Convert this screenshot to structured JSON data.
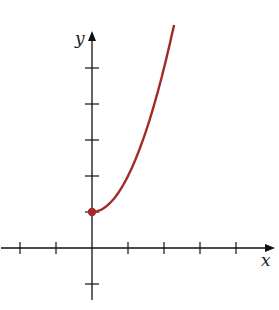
{
  "chart_data": {
    "type": "line",
    "title": "",
    "xlabel": "x",
    "ylabel": "y",
    "function": "y = x^2 + 1, x >= 0",
    "series": [
      {
        "name": "curve",
        "color": "#a32a2a",
        "x": [
          0,
          0.5,
          1,
          1.5,
          2,
          2.28
        ],
        "y": [
          1,
          1.25,
          2,
          3.25,
          5,
          6.2
        ]
      }
    ],
    "start_point": {
      "x": 0,
      "y": 1,
      "filled": true
    },
    "x_ticks": [
      -2,
      -1,
      1,
      2,
      3,
      4
    ],
    "y_ticks": [
      -1,
      1,
      2,
      3,
      4,
      5
    ],
    "xlim": [
      -2.5,
      5
    ],
    "ylim": [
      -1.5,
      6.3
    ],
    "grid": false
  },
  "axes": {
    "x_label": "x",
    "y_label": "y"
  }
}
